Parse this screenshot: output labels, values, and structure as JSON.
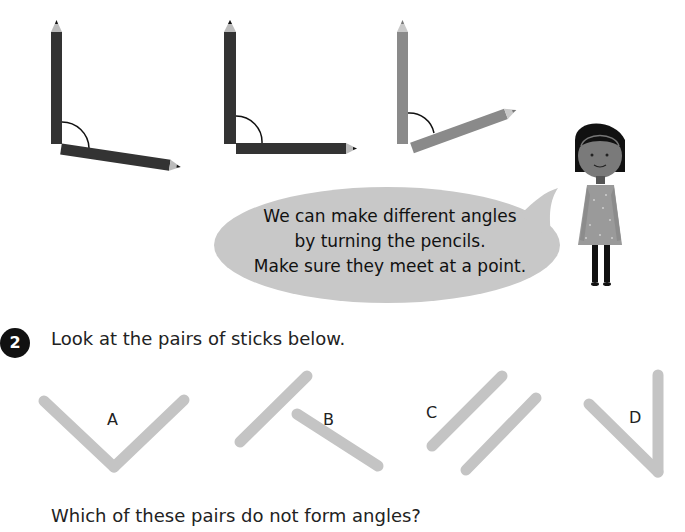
{
  "illustration": {
    "pencil_pairs": [
      {
        "id": "pencils-1",
        "color": "#333333",
        "angle_desc": "slightly obtuse"
      },
      {
        "id": "pencils-2",
        "color": "#333333",
        "angle_desc": "right angle"
      },
      {
        "id": "pencils-3",
        "color": "#8a8a8a",
        "angle_desc": "acute"
      }
    ],
    "speech_bubble": {
      "lines": [
        "We can make different angles",
        "by turning the pencils.",
        "Make sure they meet at a point."
      ],
      "color": "#c8c8c8"
    },
    "character": "girl-character"
  },
  "question": {
    "number": "2",
    "prompt": "Look at the pairs of sticks below.",
    "pairs": [
      {
        "label": "A"
      },
      {
        "label": "B"
      },
      {
        "label": "C"
      },
      {
        "label": "D"
      }
    ],
    "follow_up": "Which of these pairs do not form angles?"
  },
  "colors": {
    "stick": "#c4c4c4",
    "badge": "#111111"
  }
}
